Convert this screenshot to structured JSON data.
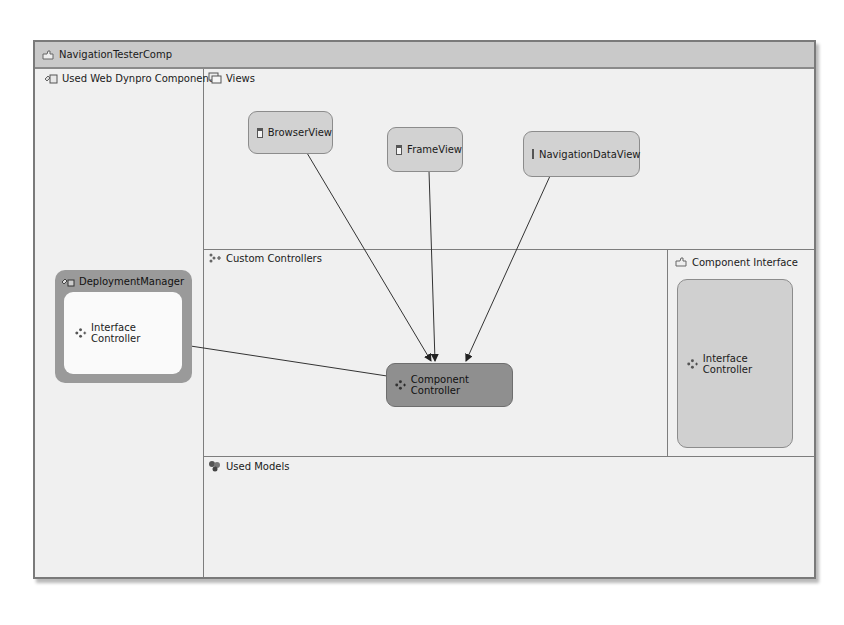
{
  "window": {
    "title": "NavigationTesterComp",
    "title_icon": "component-icon"
  },
  "panes": {
    "used_components": {
      "label": "Used Web Dynpro Components",
      "icon": "used-components-icon"
    },
    "views": {
      "label": "Views",
      "icon": "views-icon"
    },
    "custom_controllers": {
      "label": "Custom Controllers",
      "icon": "custom-controllers-icon"
    },
    "component_interface": {
      "label": "Component Interface",
      "icon": "component-interface-icon"
    },
    "used_models": {
      "label": "Used Models",
      "icon": "used-models-icon"
    }
  },
  "views": [
    {
      "label": "BrowserView",
      "icon": "window-icon"
    },
    {
      "label": "FrameView",
      "icon": "window-icon"
    },
    {
      "label": "NavigationDataView",
      "icon": "window-icon"
    }
  ],
  "deployment_manager": {
    "title": "DeploymentManager",
    "inner_label": "Interface Controller",
    "icon": "controller-icon"
  },
  "component_controller": {
    "label": "Component Controller",
    "icon": "controller-icon"
  },
  "component_interface_node": {
    "label": "Interface Controller",
    "icon": "controller-icon"
  },
  "connections": [
    {
      "from": "BrowserView",
      "to": "Component Controller"
    },
    {
      "from": "FrameView",
      "to": "Component Controller"
    },
    {
      "from": "NavigationDataView",
      "to": "Component Controller"
    },
    {
      "from": "Component Controller",
      "to": "DeploymentManager Interface Controller"
    }
  ],
  "colors": {
    "title_bar": "#c9c9c9",
    "canvas": "#f0f0f0",
    "view_node": "#d2d2d2",
    "component_controller": "#8f8f8f",
    "deployment_manager": "#9a9a9a"
  }
}
